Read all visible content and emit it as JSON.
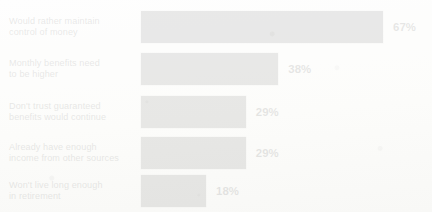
{
  "chart_data": {
    "type": "bar",
    "orientation": "horizontal",
    "title": "",
    "xlabel": "",
    "ylabel": "",
    "xlim": [
      0,
      67
    ],
    "grid": false,
    "legend": false,
    "value_suffix": "%",
    "categories": [
      "Would rather maintain\ncontrol of money",
      "Monthly benefits need\nto be higher",
      "Don't trust guaranteed\nbenefits would continue",
      "Already have enough\nincome from other sources",
      "Won't live long enough\nin retirement"
    ],
    "values": [
      67,
      38,
      29,
      29,
      18
    ],
    "value_labels": [
      "67%",
      "38%",
      "29%",
      "29%",
      "18%"
    ],
    "colors": {
      "bar": "#262626",
      "value_text": "#0d0d0d",
      "category_text": "#151515",
      "background": "#fdfdfc"
    }
  }
}
